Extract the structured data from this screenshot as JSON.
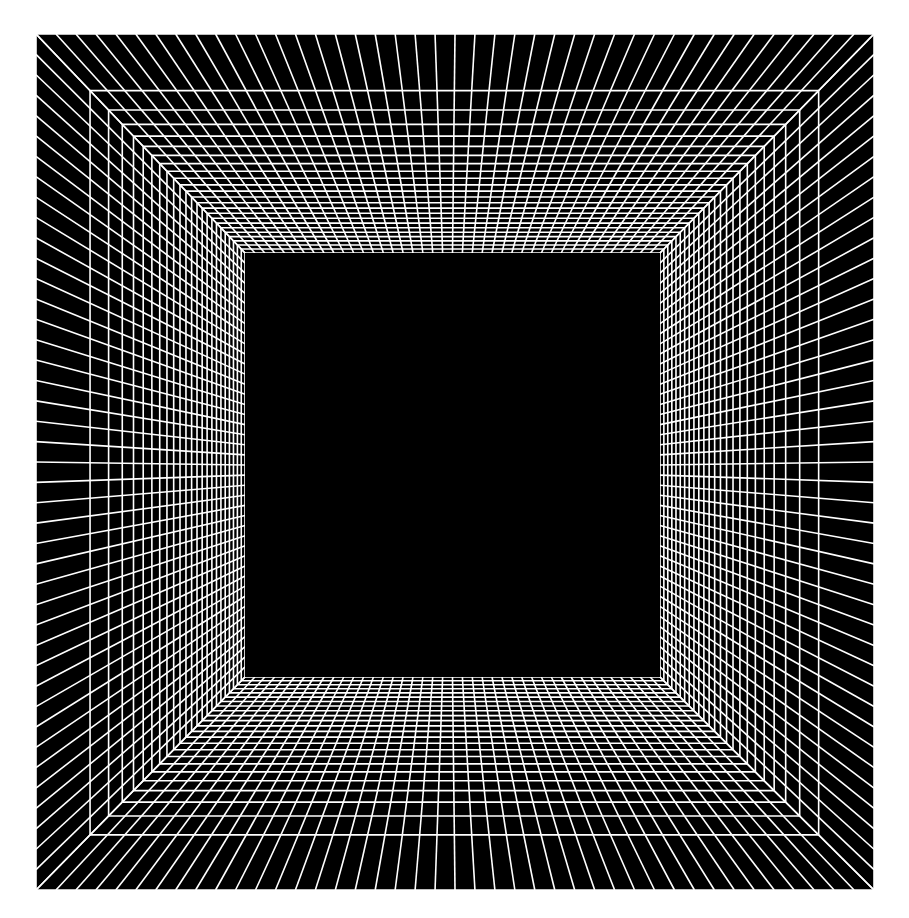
{
  "figure": {
    "type": "perspective-wireframe",
    "canvas": {
      "width": 909,
      "height": 918,
      "background_color": "#ffffff"
    },
    "colors": {
      "background": "#ffffff",
      "grid_line": "#ffffff",
      "face_fill": "#000000",
      "inner_opening_fill": "#000000"
    },
    "outer_rect": {
      "left": 36,
      "top": 34,
      "right": 874,
      "bottom": 890,
      "width": 838,
      "height": 856
    },
    "inner_rect": {
      "left": 245,
      "top": 253,
      "right": 660,
      "bottom": 677,
      "width": 415,
      "height": 424
    },
    "vanishing_point": {
      "x": 452,
      "y": 465
    },
    "grid": {
      "columns_top": 42,
      "columns_bottom": 42,
      "rows_left": 42,
      "rows_right": 42,
      "depth_rings": 24,
      "line_width_px": 1.6,
      "perspective_exponent": 2.35
    },
    "faces": [
      {
        "name": "top-face",
        "label": "ceiling"
      },
      {
        "name": "bottom-face",
        "label": "floor"
      },
      {
        "name": "left-face",
        "label": "left wall"
      },
      {
        "name": "right-face",
        "label": "right wall"
      }
    ]
  }
}
